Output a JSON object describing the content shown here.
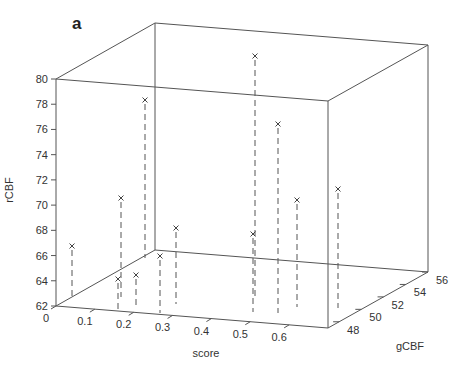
{
  "panel_label": "a",
  "chart_data": {
    "type": "scatter",
    "subtype": "3d-stem-scatter",
    "title": "",
    "panel_label": "a",
    "xlabel": "score",
    "ylabel": "gCBF",
    "zlabel": "rCBF",
    "xlim": [
      0,
      0.7
    ],
    "ylim": [
      47,
      56
    ],
    "zlim": [
      62,
      80
    ],
    "x_ticks": [
      0,
      0.1,
      0.2,
      0.3,
      0.4,
      0.5,
      0.6
    ],
    "x_tick_labels": [
      "0",
      "0.1",
      "0.2",
      "0.3",
      "0.4",
      "0.5",
      "0.6"
    ],
    "y_ticks": [
      48,
      50,
      52,
      54,
      56
    ],
    "y_tick_labels": [
      "48",
      "50",
      "52",
      "54",
      "56"
    ],
    "z_ticks": [
      62,
      64,
      66,
      68,
      70,
      72,
      74,
      76,
      78,
      80
    ],
    "z_tick_labels": [
      "62",
      "64",
      "66",
      "68",
      "70",
      "72",
      "74",
      "76",
      "78",
      "80"
    ],
    "marker": "x",
    "stem_style": "dashed",
    "grid": false,
    "box": true,
    "points_screen": [
      {
        "sx": 72,
        "sy": 246,
        "bx": 72,
        "by": 297
      },
      {
        "sx": 121,
        "sy": 198,
        "bx": 121,
        "by": 297
      },
      {
        "sx": 145,
        "sy": 100,
        "bx": 145,
        "by": 258
      },
      {
        "sx": 118,
        "sy": 279,
        "bx": 118,
        "by": 310
      },
      {
        "sx": 136,
        "sy": 275,
        "bx": 136,
        "by": 306
      },
      {
        "sx": 160,
        "sy": 256,
        "bx": 160,
        "by": 313
      },
      {
        "sx": 176,
        "sy": 228,
        "bx": 176,
        "by": 304
      },
      {
        "sx": 255,
        "sy": 56,
        "bx": 255,
        "by": 300
      },
      {
        "sx": 253,
        "sy": 234,
        "bx": 253,
        "by": 312
      },
      {
        "sx": 278,
        "sy": 124,
        "bx": 278,
        "by": 313
      },
      {
        "sx": 297,
        "sy": 200,
        "bx": 297,
        "by": 307
      },
      {
        "sx": 338,
        "sy": 189,
        "bx": 338,
        "by": 308
      }
    ],
    "points": [
      {
        "score": 0.05,
        "gCBF": 49.0,
        "rCBF": 66.7
      },
      {
        "score": 0.17,
        "gCBF": 51.5,
        "rCBF": 70.5
      },
      {
        "score": 0.19,
        "gCBF": 55.0,
        "rCBF": 78.3
      },
      {
        "score": 0.19,
        "gCBF": 48.0,
        "rCBF": 64.1
      },
      {
        "score": 0.22,
        "gCBF": 49.0,
        "rCBF": 64.4
      },
      {
        "score": 0.29,
        "gCBF": 47.5,
        "rCBF": 66.0
      },
      {
        "score": 0.31,
        "gCBF": 50.5,
        "rCBF": 68.2
      },
      {
        "score": 0.5,
        "gCBF": 55.0,
        "rCBF": 81.5
      },
      {
        "score": 0.53,
        "gCBF": 48.5,
        "rCBF": 67.8
      },
      {
        "score": 0.56,
        "gCBF": 49.5,
        "rCBF": 74.2
      },
      {
        "score": 0.59,
        "gCBF": 51.5,
        "rCBF": 70.5
      },
      {
        "score": 0.65,
        "gCBF": 53.0,
        "rCBF": 71.3
      }
    ]
  }
}
